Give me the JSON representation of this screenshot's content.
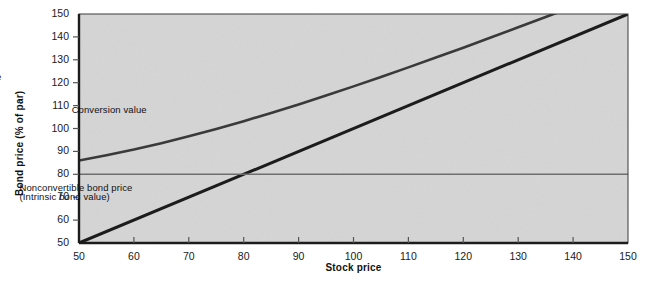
{
  "chart_data": {
    "type": "line",
    "title": "",
    "xlabel": "Stock price",
    "ylabel": "Bond price (% of par)",
    "xlim": [
      50,
      150
    ],
    "ylim": [
      50,
      150
    ],
    "xticks": [
      50,
      60,
      70,
      80,
      90,
      100,
      110,
      120,
      130,
      140,
      150
    ],
    "yticks": [
      50,
      60,
      70,
      80,
      90,
      100,
      110,
      120,
      130,
      140,
      150
    ],
    "grid": false,
    "legend": "inline-annotations",
    "plot_background": "#d5d5d5",
    "series": [
      {
        "name": "Convertible bond price",
        "color": "#3a3a3a",
        "width": 2.6,
        "x": [
          50,
          55,
          60,
          65,
          70,
          75,
          80,
          85,
          90,
          95,
          100,
          105,
          110,
          115,
          120,
          125,
          130,
          135,
          140,
          145,
          150
        ],
        "y": [
          86.0,
          88.3,
          90.8,
          93.6,
          96.6,
          99.8,
          103.2,
          106.8,
          110.5,
          114.4,
          118.4,
          122.5,
          126.7,
          131.0,
          135.3,
          139.7,
          144.2,
          148.7,
          153.2,
          157.8,
          162.4
        ]
      },
      {
        "name": "Conversion value",
        "color": "#1c1c1c",
        "width": 3.0,
        "x": [
          50,
          150
        ],
        "y": [
          50,
          150
        ]
      },
      {
        "name": "Nonconvertible bond price",
        "color": "#6e6e6e",
        "width": 1.6,
        "x": [
          50,
          150
        ],
        "y": [
          80,
          80
        ]
      }
    ],
    "annotations": [
      {
        "text": "Convertible bond price",
        "x": 79.0,
        "y": 122.0,
        "align": "center"
      },
      {
        "text": "Conversion value",
        "x": 109.5,
        "y": 107.5,
        "align": "center"
      },
      {
        "text": "Nonconvertible bond price",
        "x": 100.0,
        "y": 73.5,
        "align": "center"
      },
      {
        "text": "(Intrinsic bond value)",
        "x": 100.0,
        "y": 69.5,
        "align": "center"
      }
    ],
    "axis_color": "#1c1c1c",
    "tick_color": "#555555"
  }
}
